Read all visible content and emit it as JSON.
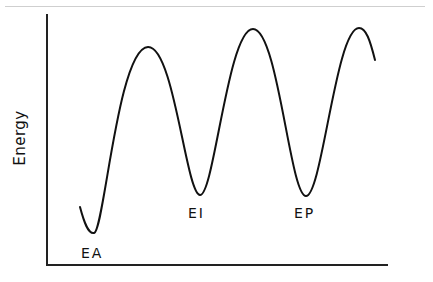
{
  "diagram": {
    "type": "energy-profile",
    "ylabel": "Energy",
    "xlabel": "",
    "line_color": "#111111",
    "labels": [
      {
        "id": "ea",
        "text": "EA",
        "x": 81,
        "y": 245
      },
      {
        "id": "ei",
        "text": "EI",
        "x": 188,
        "y": 205
      },
      {
        "id": "ep",
        "text": "EP",
        "x": 294,
        "y": 205
      }
    ],
    "curve_path": "M80,207 C84,222 88,234 94,233 C104,232 118,48 148,47 C174,46 186,194 200,195 C214,196 228,29 253,29 C278,29 290,196 306,196 C322,196 336,28 359,28 C366,28 370,40 375,60",
    "minima": [
      {
        "label": "EA",
        "x": 93,
        "y": 233
      },
      {
        "label": "EI",
        "x": 200,
        "y": 195
      },
      {
        "label": "EP",
        "x": 306,
        "y": 196
      }
    ],
    "maxima": [
      {
        "x": 148,
        "y": 47
      },
      {
        "x": 253,
        "y": 29
      },
      {
        "x": 359,
        "y": 28
      }
    ]
  }
}
